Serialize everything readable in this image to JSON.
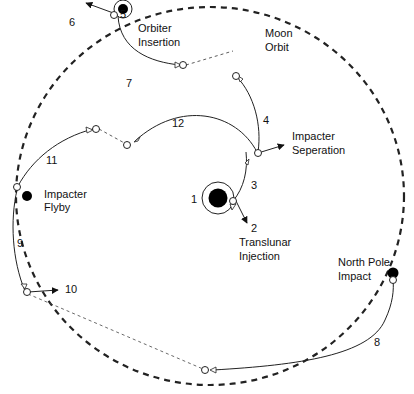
{
  "diagram": {
    "orbit_label": [
      "Moon",
      "Orbit"
    ],
    "events": [
      {
        "id": "1",
        "label": ""
      },
      {
        "id": "2",
        "label": [
          "Translunar",
          "Injection"
        ]
      },
      {
        "id": "3",
        "label": ""
      },
      {
        "id": "4",
        "label": ""
      },
      {
        "id": "5",
        "label": [
          "Orbiter",
          "Insertion"
        ]
      },
      {
        "id": "6",
        "label": ""
      },
      {
        "id": "7",
        "label": ""
      },
      {
        "id": "8",
        "label": ""
      },
      {
        "id": "9",
        "label": ""
      },
      {
        "id": "10",
        "label": ""
      },
      {
        "id": "11",
        "label": ""
      },
      {
        "id": "12",
        "label": ""
      }
    ],
    "annotations": {
      "impacter_separation": [
        "Impacter",
        "Seperation"
      ],
      "impacter_flyby": [
        "Impacter",
        "Flyby"
      ],
      "north_pole_impact": [
        "North Pole",
        "Impact"
      ]
    },
    "colors": {
      "line": "#222222",
      "body_fill": "#000000",
      "node_fill": "#ffffff"
    }
  }
}
